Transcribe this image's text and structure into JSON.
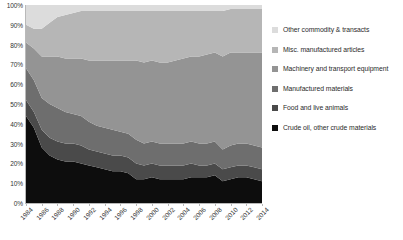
{
  "chart_data": {
    "type": "area",
    "title": "",
    "subtitle": "",
    "xlabel": "",
    "ylabel": "",
    "stacked": true,
    "normalized": true,
    "grid": false,
    "legend_position": "right",
    "ylim": [
      0,
      100
    ],
    "y_ticks": [
      "0%",
      "10%",
      "20%",
      "30%",
      "40%",
      "50%",
      "60%",
      "70%",
      "80%",
      "90%",
      "100%"
    ],
    "y_tick_values": [
      0,
      10,
      20,
      30,
      40,
      50,
      60,
      70,
      80,
      90,
      100
    ],
    "x_tick_labels": [
      "1984",
      "1986",
      "1988",
      "1990",
      "1992",
      "1994",
      "1996",
      "1998",
      "2000",
      "2002",
      "2004",
      "2006",
      "2008",
      "2010",
      "2012",
      "2014"
    ],
    "x": [
      1984,
      1985,
      1986,
      1987,
      1988,
      1989,
      1990,
      1991,
      1992,
      1993,
      1994,
      1995,
      1996,
      1997,
      1998,
      1999,
      2000,
      2001,
      2002,
      2003,
      2004,
      2005,
      2006,
      2007,
      2008,
      2009,
      2010,
      2011,
      2012,
      2013,
      2014
    ],
    "xlim": [
      1984,
      2014
    ],
    "series": [
      {
        "name": "Crude oil, other crude materials",
        "color": "#0d0d0d",
        "values": [
          44,
          38,
          28,
          24,
          22,
          21,
          21,
          20,
          19,
          18,
          17,
          16,
          16,
          15,
          12,
          12,
          13,
          12,
          12,
          12,
          12,
          13,
          13,
          13,
          14,
          11,
          12,
          13,
          13,
          12,
          11
        ]
      },
      {
        "name": "Food and live animals",
        "color": "#4a4a4a",
        "values": [
          8,
          8,
          9,
          9,
          9,
          9,
          9,
          9,
          8,
          8,
          8,
          8,
          8,
          8,
          8,
          7,
          7,
          7,
          7,
          7,
          7,
          7,
          6,
          6,
          6,
          6,
          6,
          6,
          6,
          6,
          6
        ]
      },
      {
        "name": "Manufactured materials",
        "color": "#6e6e6e",
        "values": [
          16,
          16,
          16,
          17,
          17,
          16,
          15,
          15,
          14,
          13,
          13,
          13,
          12,
          12,
          12,
          11,
          11,
          11,
          11,
          11,
          11,
          11,
          11,
          11,
          11,
          10,
          11,
          11,
          11,
          11,
          11
        ]
      },
      {
        "name": "Machinery and transport equipment",
        "color": "#949494",
        "values": [
          13,
          16,
          21,
          24,
          26,
          27,
          28,
          29,
          31,
          33,
          34,
          35,
          36,
          37,
          40,
          41,
          41,
          41,
          41,
          42,
          43,
          43,
          44,
          45,
          45,
          47,
          47,
          46,
          46,
          47,
          48
        ]
      },
      {
        "name": "Misc. manufactured articles",
        "color": "#b6b6b6",
        "values": [
          9,
          10,
          14,
          17,
          20,
          22,
          23,
          24,
          25,
          25,
          25,
          25,
          25,
          25,
          25,
          26,
          25,
          26,
          26,
          25,
          24,
          23,
          23,
          22,
          21,
          23,
          22,
          22,
          22,
          22,
          22
        ]
      },
      {
        "name": "Other commodity & transacts",
        "color": "#dcdcdc",
        "values": [
          10,
          12,
          12,
          9,
          6,
          5,
          4,
          3,
          3,
          3,
          3,
          3,
          3,
          3,
          3,
          3,
          3,
          3,
          3,
          3,
          3,
          3,
          3,
          3,
          3,
          3,
          2,
          2,
          2,
          2,
          2
        ]
      }
    ]
  },
  "legend": {
    "items": [
      {
        "label": "Other commodity & transacts",
        "color": "#dcdcdc"
      },
      {
        "label": "Misc. manufactured articles",
        "color": "#b6b6b6"
      },
      {
        "label": "Machinery and transport equipment",
        "color": "#949494"
      },
      {
        "label": "Manufactured materials",
        "color": "#6e6e6e"
      },
      {
        "label": "Food and live animals",
        "color": "#4a4a4a"
      },
      {
        "label": "Crude oil, other crude materials",
        "color": "#0d0d0d"
      }
    ]
  }
}
